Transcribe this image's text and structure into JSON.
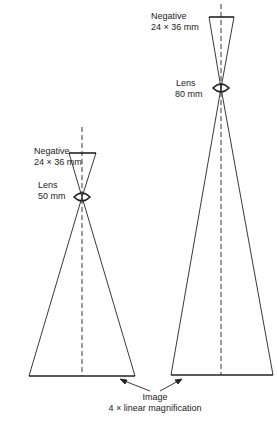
{
  "left_diagram": {
    "negative_label": "Negative",
    "negative_size": "24 × 36 mm",
    "lens_label": "Lens",
    "lens_focal": "50 mm"
  },
  "right_diagram": {
    "negative_label": "Negative",
    "negative_size": "24 × 36 mm",
    "lens_label": "Lens",
    "lens_focal": "80 mm"
  },
  "image_caption": {
    "title": "Image",
    "subtitle": "4 × linear magnification"
  },
  "colors": {
    "line": "#222222",
    "background": "#ffffff"
  }
}
